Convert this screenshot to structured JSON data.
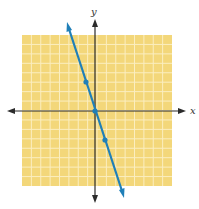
{
  "chart_data": {
    "type": "line",
    "title": "",
    "xlabel": "x",
    "ylabel": "y",
    "xlim": [
      -8,
      8
    ],
    "ylim": [
      -8,
      8
    ],
    "grid": true,
    "legend": null,
    "series": [
      {
        "name": "y = -3x",
        "color": "#1f7fb8",
        "points": [
          {
            "x": -1,
            "y": 3
          },
          {
            "x": 0,
            "y": 0
          },
          {
            "x": 1,
            "y": -3
          }
        ],
        "line_extends_both_directions": true
      }
    ]
  },
  "labels": {
    "x_axis": "x",
    "y_axis": "y"
  },
  "colors": {
    "grid_background": "#f3d77a",
    "grid_lines": "#fbeec0",
    "axes": "#2b2b2b",
    "line": "#1f7fb8"
  }
}
